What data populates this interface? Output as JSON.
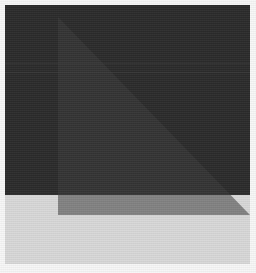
{
  "canvas": {
    "width": 256,
    "height": 273,
    "background_color": "#f7f7f7",
    "description": "Abstract geometric composition: a large dark charcoal square over a light gray lower band, with a translucent right triangle overlaid."
  },
  "shapes": {
    "dark_square": {
      "name": "dark-square",
      "fill": "#2b2b2b",
      "x": 5,
      "y": 5,
      "width": 245,
      "height": 190
    },
    "light_band": {
      "name": "light-band",
      "fill": "#d8d8d8",
      "x": 5,
      "y": 195,
      "width": 245,
      "height": 69
    },
    "triangle": {
      "name": "overlay-triangle",
      "fill": "#3d3d3d",
      "opacity": 0.55,
      "points": "58,17 58,215 250,215",
      "apex": [
        58,
        17
      ],
      "bottom_left": [
        58,
        215
      ],
      "bottom_right": [
        250,
        215
      ]
    },
    "bands": [
      {
        "name": "scanline-upper",
        "y": 63,
        "color": "#343434"
      },
      {
        "name": "scanline-lower",
        "y": 72,
        "color": "#343434"
      }
    ]
  },
  "palette": {
    "background": "#f7f7f7",
    "dark": "#2b2b2b",
    "triangle": "#3d3d3d",
    "light": "#d8d8d8",
    "band": "#343434"
  }
}
